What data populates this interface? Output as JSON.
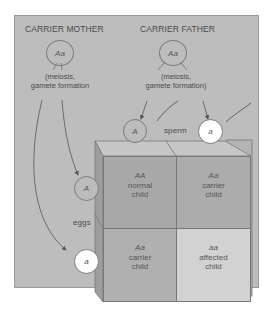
{
  "parents": {
    "mother": {
      "label": "CARRIER MOTHER",
      "genotype": "Aa",
      "process": "(meiosis,\ngamete formation"
    },
    "father": {
      "label": "CARRIER FATHER",
      "genotype": "Aa",
      "process": "(meiosis,\ngamete formation)"
    }
  },
  "gametes": {
    "sperm_label": "sperm",
    "eggs_label": "eggs",
    "sperm": [
      {
        "allele": "A",
        "fill": "gray"
      },
      {
        "allele": "a",
        "fill": "white"
      }
    ],
    "eggs": [
      {
        "allele": "A",
        "fill": "gray"
      },
      {
        "allele": "a",
        "fill": "white"
      }
    ]
  },
  "grid": {
    "cells": [
      {
        "genotype": "AA",
        "line1": "normal",
        "line2": "child",
        "color": "#a9a9a9"
      },
      {
        "genotype": "Aa",
        "line1": "carrier",
        "line2": "child",
        "color": "#acacac"
      },
      {
        "genotype": "Aa",
        "line1": "carrier",
        "line2": "child",
        "color": "#b0b0b0"
      },
      {
        "genotype": "aa",
        "line1": "affected",
        "line2": "child",
        "color": "#d2d2d2"
      }
    ]
  },
  "colors": {
    "panel": "#bdbdbd",
    "line": "#6e6e6e",
    "box_top": "#c8c8c8",
    "box_side": "#9c9c9c"
  }
}
